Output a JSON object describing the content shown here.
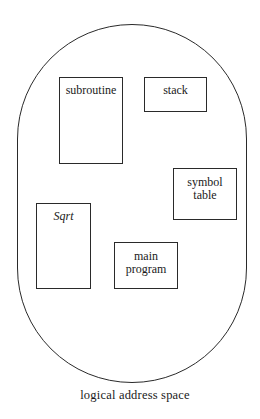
{
  "diagram": {
    "caption": "logical address space",
    "segments": [
      {
        "id": "subroutine",
        "label": "subroutine",
        "italic": false,
        "box": [
          59,
          77,
          64,
          87
        ]
      },
      {
        "id": "stack",
        "label": "stack",
        "italic": false,
        "box": [
          144,
          77,
          63,
          35
        ]
      },
      {
        "id": "symbol-table",
        "label_lines": [
          "symbol",
          "table"
        ],
        "italic": false,
        "box": [
          173,
          168,
          64,
          52
        ]
      },
      {
        "id": "sqrt",
        "label": "Sqrt",
        "italic": true,
        "box": [
          36,
          203,
          55,
          86
        ]
      },
      {
        "id": "main-program",
        "label_lines": [
          "main",
          "program"
        ],
        "italic": false,
        "box": [
          114,
          242,
          64,
          47
        ]
      }
    ],
    "colors": {
      "stroke": "#2a2a2a",
      "background": "#ffffff",
      "text": "#1a1a1a"
    }
  }
}
